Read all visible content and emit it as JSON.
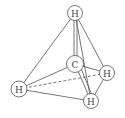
{
  "diagram": {
    "title": "",
    "stroke_color": "#555555",
    "atoms": [
      {
        "id": "h_top",
        "label": "H",
        "cx": 75,
        "cy": 13,
        "r": 7.5
      },
      {
        "id": "c_center",
        "label": "C",
        "cx": 75,
        "cy": 64,
        "r": 8.5
      },
      {
        "id": "h_right",
        "label": "H",
        "cx": 107,
        "cy": 73,
        "r": 7.5
      },
      {
        "id": "h_left",
        "label": "H",
        "cx": 19,
        "cy": 89,
        "r": 8
      },
      {
        "id": "h_bottom",
        "label": "H",
        "cx": 91,
        "cy": 101,
        "r": 7.5
      }
    ],
    "bonds": [
      {
        "from": "h_top",
        "to": "h_left",
        "style": "solid"
      },
      {
        "from": "h_top",
        "to": "c_center",
        "style": "solid"
      },
      {
        "from": "h_top",
        "to": "h_right",
        "style": "solid"
      },
      {
        "from": "h_top",
        "to": "h_bottom",
        "style": "solid"
      },
      {
        "from": "h_left",
        "to": "c_center",
        "style": "solid"
      },
      {
        "from": "h_left",
        "to": "h_bottom",
        "style": "solid"
      },
      {
        "from": "h_left",
        "to": "h_right",
        "style": "dashed"
      },
      {
        "from": "c_center",
        "to": "h_right",
        "style": "solid"
      },
      {
        "from": "c_center",
        "to": "h_bottom",
        "style": "solid"
      },
      {
        "from": "h_right",
        "to": "h_bottom",
        "style": "solid"
      }
    ]
  }
}
